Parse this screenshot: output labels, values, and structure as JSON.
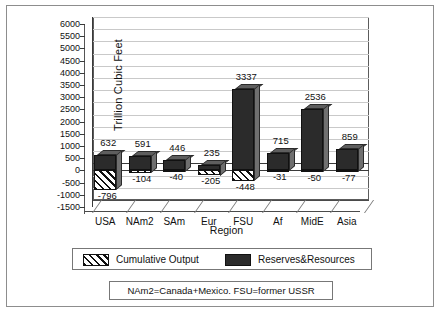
{
  "chart_data": {
    "type": "bar",
    "title": "",
    "xlabel": "Region",
    "ylabel": "Trillion Cubic Feet",
    "ylim": [
      -1500,
      6000
    ],
    "ytick_step": 500,
    "yticks": [
      "6000",
      "5500",
      "5000",
      "4500",
      "4000",
      "3500",
      "3000",
      "2500",
      "2000",
      "1500",
      "1000",
      "500",
      "0",
      "-500",
      "-1000",
      "-1500"
    ],
    "grid": true,
    "legend_position": "bottom",
    "categories": [
      "USA",
      "NAm2",
      "SAm",
      "Eur",
      "FSU",
      "Af",
      "MidE",
      "Asia"
    ],
    "series": [
      {
        "name": "Reserves&Resources",
        "values": [
          632,
          591,
          446,
          235,
          3337,
          715,
          2536,
          859
        ],
        "labels": [
          "632",
          "591",
          "446",
          "235",
          "3337",
          "715",
          "2536",
          "859"
        ],
        "color": "#2b2b2b",
        "pattern": "solid"
      },
      {
        "name": "Cumulative Output",
        "values": [
          -796,
          -104,
          -40,
          -205,
          -448,
          -31,
          -50,
          -77
        ],
        "labels": [
          "-796",
          "-104",
          "-40",
          "-205",
          "-448",
          "-31",
          "-50",
          "-77"
        ],
        "color": "#111111",
        "pattern": "diagonal-hatch"
      }
    ],
    "footnote": "NAm2=Canada+Mexico.  FSU=former USSR"
  },
  "legend": {
    "items": [
      {
        "label": "Cumulative Output",
        "swatch": "hatch-swatch-icon"
      },
      {
        "label": "Reserves&Resources",
        "swatch": "solid-swatch-icon"
      }
    ]
  }
}
